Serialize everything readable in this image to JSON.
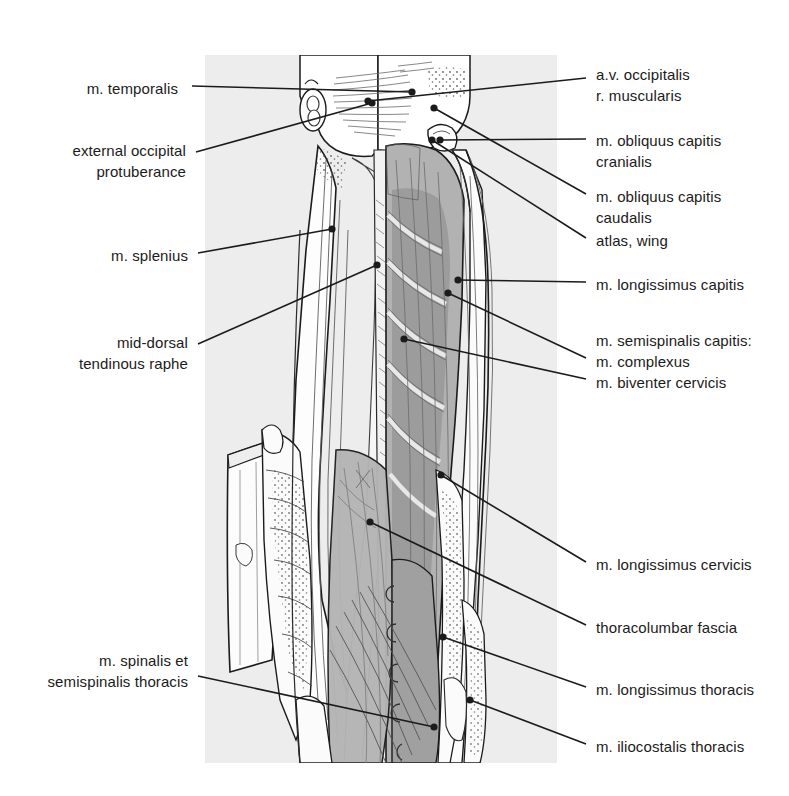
{
  "figure": {
    "kind": "anatomical-illustration",
    "panel": {
      "background_color": "#ededed",
      "x": 205,
      "y": 55,
      "width": 352,
      "height": 708
    },
    "colors": {
      "ink": "#1b1b1b",
      "leader_line": "#1b1b1b",
      "panel_gray": "#ededed",
      "muscle_mid_gray": "#b5b5b5",
      "muscle_dark_gray": "#9a9a9a",
      "fascia_light": "#fbfbfb",
      "paper": "#ffffff"
    }
  },
  "labels_left": [
    {
      "id": "m-temporalis",
      "lines": [
        "m. temporalis"
      ],
      "text_x": 178,
      "text_y": 78,
      "align": "right",
      "leader": [
        [
          192,
          86
        ],
        [
          412,
          92
        ]
      ],
      "dot": [
        412,
        92
      ]
    },
    {
      "id": "external-occipital-protuberance",
      "lines": [
        "external occipital",
        "protuberance"
      ],
      "text_x": 186,
      "text_y": 140,
      "align": "right",
      "leader": [
        [
          196,
          152
        ],
        [
          372,
          103
        ]
      ],
      "dot": [
        372,
        103
      ]
    },
    {
      "id": "m-splenius",
      "lines": [
        "m. splenius"
      ],
      "text_x": 188,
      "text_y": 245,
      "align": "right",
      "leader": [
        [
          198,
          253
        ],
        [
          332,
          229
        ]
      ],
      "dot": [
        332,
        229
      ]
    },
    {
      "id": "mid-dorsal-tendinous-raphe",
      "lines": [
        "mid-dorsal",
        "tendinous raphe"
      ],
      "text_x": 188,
      "text_y": 332,
      "align": "right",
      "leader": [
        [
          198,
          344
        ],
        [
          377,
          265
        ]
      ],
      "dot": [
        377,
        265
      ]
    },
    {
      "id": "m-spinalis-et-semispinalis-thoracis",
      "lines": [
        "m. spinalis et",
        "semispinalis thoracis"
      ],
      "text_x": 188,
      "text_y": 650,
      "align": "right",
      "leader": [
        [
          198,
          676
        ],
        [
          434,
          727
        ]
      ],
      "dot": [
        434,
        727
      ]
    }
  ],
  "labels_right": [
    {
      "id": "av-occipitalis-r-muscularis",
      "lines": [
        "a.v. occipitalis",
        "r. muscularis"
      ],
      "text_x": 596,
      "text_y": 64,
      "align": "left",
      "leader": [
        [
          586,
          78
        ],
        [
          368,
          101
        ]
      ],
      "dot": [
        368,
        101
      ]
    },
    {
      "id": "m-obliquus-capitis-cranialis",
      "lines": [
        "m. obliquus capitis",
        "cranialis"
      ],
      "text_x": 596,
      "text_y": 130,
      "align": "left",
      "leader": [
        [
          586,
          139
        ],
        [
          440,
          140
        ]
      ],
      "dot": [
        440,
        140
      ]
    },
    {
      "id": "m-obliquus-capitis-caudalis",
      "lines": [
        "m. obliquus capitis",
        "caudalis"
      ],
      "text_x": 596,
      "text_y": 186,
      "align": "left",
      "leader": [
        [
          586,
          194
        ],
        [
          434,
          108
        ]
      ],
      "dot": [
        434,
        108
      ]
    },
    {
      "id": "atlas-wing",
      "lines": [
        "atlas, wing"
      ],
      "text_x": 596,
      "text_y": 230,
      "align": "left",
      "leader": [
        [
          586,
          238
        ],
        [
          432,
          140
        ]
      ],
      "dot": [
        432,
        140
      ]
    },
    {
      "id": "m-longissimus-capitis",
      "lines": [
        "m. longissimus capitis"
      ],
      "text_x": 596,
      "text_y": 274,
      "align": "left",
      "leader": [
        [
          586,
          282
        ],
        [
          458,
          280
        ]
      ],
      "dot": [
        458,
        280
      ]
    },
    {
      "id": "m-semispinalis-capitis",
      "lines": [
        "m. semispinalis capitis:",
        "m. complexus",
        "m. biventer cervicis"
      ],
      "text_x": 596,
      "text_y": 330,
      "align": "left",
      "leader": [
        [
          586,
          358
        ],
        [
          448,
          293
        ]
      ],
      "dot": [
        448,
        293
      ],
      "leader2": [
        [
          586,
          379
        ],
        [
          404,
          339
        ]
      ],
      "dot2": [
        404,
        339
      ]
    },
    {
      "id": "m-longissimus-cervicis",
      "lines": [
        "m. longissimus cervicis"
      ],
      "text_x": 596,
      "text_y": 554,
      "align": "left",
      "leader": [
        [
          586,
          562
        ],
        [
          441,
          475
        ]
      ],
      "dot": [
        441,
        475
      ]
    },
    {
      "id": "thoracolumbar-fascia",
      "lines": [
        "thoracolumbar fascia"
      ],
      "text_x": 596,
      "text_y": 617,
      "align": "left",
      "leader": [
        [
          586,
          625
        ],
        [
          370,
          522
        ]
      ],
      "dot": [
        370,
        522
      ]
    },
    {
      "id": "m-longissimus-thoracis",
      "lines": [
        "m. longissimus thoracis"
      ],
      "text_x": 596,
      "text_y": 679,
      "align": "left",
      "leader": [
        [
          586,
          687
        ],
        [
          443,
          637
        ]
      ],
      "dot": [
        443,
        637
      ]
    },
    {
      "id": "m-iliocostalis-thoracis",
      "lines": [
        "m. iliocostalis thoracis"
      ],
      "text_x": 596,
      "text_y": 736,
      "align": "left",
      "leader": [
        [
          586,
          744
        ],
        [
          470,
          700
        ]
      ],
      "dot": [
        470,
        700
      ]
    }
  ]
}
